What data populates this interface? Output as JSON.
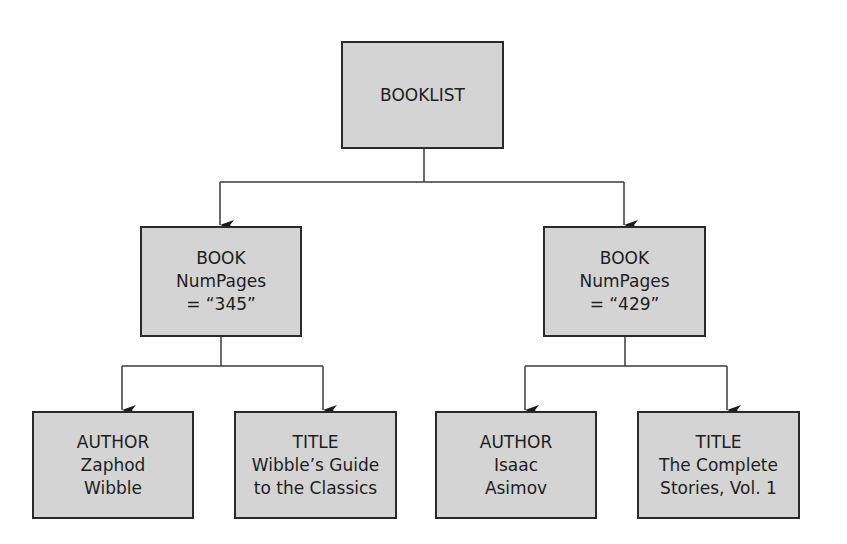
{
  "diagram": {
    "type": "tree",
    "colors": {
      "node_fill": "#d4d4d4",
      "node_border": "#2a2a2a",
      "line": "#3a3a3a",
      "text": "#1e1e1e"
    },
    "root": {
      "id": "booklist",
      "lines": [
        "BOOKLIST"
      ]
    },
    "books": [
      {
        "id": "book-1",
        "lines": [
          "BOOK",
          "NumPages",
          "= “345”"
        ],
        "children": [
          {
            "id": "author-1",
            "lines": [
              "AUTHOR",
              "Zaphod",
              "Wibble"
            ]
          },
          {
            "id": "title-1",
            "lines": [
              "TITLE",
              "Wibble’s Guide",
              "to the Classics"
            ]
          }
        ]
      },
      {
        "id": "book-2",
        "lines": [
          "BOOK",
          "NumPages",
          "= “429”"
        ],
        "children": [
          {
            "id": "author-2",
            "lines": [
              "AUTHOR",
              "Isaac",
              "Asimov"
            ]
          },
          {
            "id": "title-2",
            "lines": [
              "TITLE",
              "The Complete",
              "Stories, Vol. 1"
            ]
          }
        ]
      }
    ]
  }
}
